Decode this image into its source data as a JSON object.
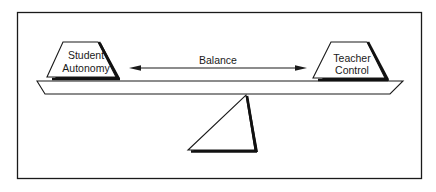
{
  "diagram": {
    "type": "balance-scale",
    "left_weight": {
      "line1": "Student",
      "line2": "Autonomy"
    },
    "right_weight": {
      "line1": "Teacher",
      "line2": "Control"
    },
    "arrow_label": "Balance",
    "colors": {
      "stroke": "#1a1a1a",
      "fill": "#ffffff",
      "shadow": "#111111"
    }
  }
}
